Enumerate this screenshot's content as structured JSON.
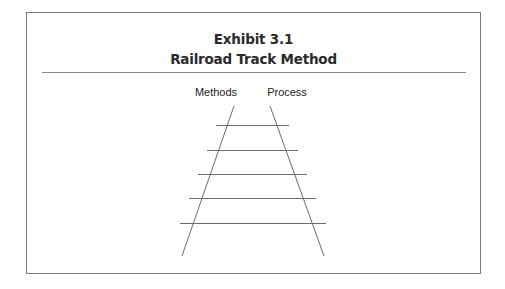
{
  "exhibit": {
    "number_label": "Exhibit 3.1",
    "title": "Railroad Track Method"
  },
  "diagram": {
    "rail_labels": {
      "left": "Methods",
      "right": "Process"
    },
    "colors": {
      "line": "#6b6b6b",
      "border": "#7a7a7a",
      "text": "#222222"
    },
    "rails": {
      "left": {
        "x1": 234,
        "y1": 106,
        "x2": 182,
        "y2": 256
      },
      "right": {
        "x1": 270,
        "y1": 106,
        "x2": 324,
        "y2": 256
      }
    },
    "ties": [
      {
        "y": 125,
        "x1": 216,
        "x2": 289
      },
      {
        "y": 150,
        "x1": 207,
        "x2": 298
      },
      {
        "y": 174,
        "x1": 198,
        "x2": 307
      },
      {
        "y": 198,
        "x1": 189,
        "x2": 316
      },
      {
        "y": 223,
        "x1": 180,
        "x2": 326
      }
    ]
  }
}
